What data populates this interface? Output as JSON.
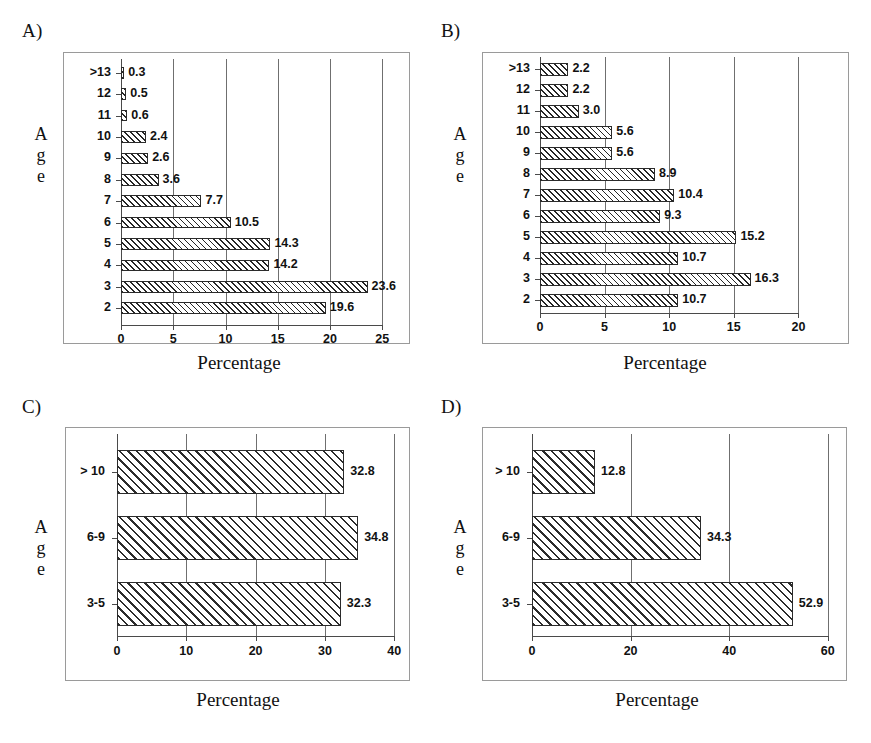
{
  "figure": {
    "panels": [
      {
        "letter": "A)",
        "axis_label_y": "Age",
        "axis_label_x": "Percentage",
        "categories": [
          ">13",
          "12",
          "11",
          "10",
          "9",
          "8",
          "7",
          "6",
          "5",
          "4",
          "3",
          "2"
        ],
        "values": [
          0.3,
          0.5,
          0.6,
          2.4,
          2.6,
          3.6,
          7.7,
          10.5,
          14.3,
          14.2,
          23.6,
          19.6
        ],
        "value_labels": [
          "0.3",
          "0.5",
          "0.6",
          "2.4",
          "2.6",
          "3.6",
          "7.7",
          "10.5",
          "14.3",
          "14.2",
          "23.6",
          "19.6"
        ],
        "xticks": [
          0,
          5,
          10,
          15,
          20,
          25
        ],
        "xtick_labels": [
          "0",
          "5",
          "10",
          "15",
          "20",
          "25"
        ],
        "xlim": [
          0,
          25
        ]
      },
      {
        "letter": "B)",
        "axis_label_y": "Age",
        "axis_label_x": "Percentage",
        "categories": [
          ">13",
          "12",
          "11",
          "10",
          "9",
          "8",
          "7",
          "6",
          "5",
          "4",
          "3",
          "2"
        ],
        "values": [
          2.2,
          2.2,
          3.0,
          5.6,
          5.6,
          8.9,
          10.4,
          9.3,
          15.2,
          10.7,
          16.3,
          10.7
        ],
        "value_labels": [
          "2.2",
          "2.2",
          "3.0",
          "5.6",
          "5.6",
          "8.9",
          "10.4",
          "9.3",
          "15.2",
          "10.7",
          "16.3",
          "10.7"
        ],
        "xticks": [
          0,
          5,
          10,
          15,
          20
        ],
        "xtick_labels": [
          "0",
          "5",
          "10",
          "15",
          "20"
        ],
        "xlim": [
          0,
          20
        ]
      },
      {
        "letter": "C)",
        "axis_label_y": "Age",
        "axis_label_x": "Percentage",
        "categories": [
          "> 10",
          "6-9",
          "3-5"
        ],
        "values": [
          32.8,
          34.8,
          32.3
        ],
        "value_labels": [
          "32.8",
          "34.8",
          "32.3"
        ],
        "xticks": [
          0,
          10,
          20,
          30,
          40
        ],
        "xtick_labels": [
          "0",
          "10",
          "20",
          "30",
          "40"
        ],
        "xlim": [
          0,
          40
        ]
      },
      {
        "letter": "D)",
        "axis_label_y": "Age",
        "axis_label_x": "Percentage",
        "categories": [
          "> 10",
          "6-9",
          "3-5"
        ],
        "values": [
          12.8,
          34.3,
          52.9
        ],
        "value_labels": [
          "12.8",
          "34.3",
          "52.9"
        ],
        "xticks": [
          0,
          20,
          40,
          60
        ],
        "xtick_labels": [
          "0",
          "20",
          "40",
          "60"
        ],
        "xlim": [
          0,
          60
        ]
      }
    ]
  },
  "chart_data": [
    {
      "type": "bar",
      "orientation": "horizontal",
      "panel": "A",
      "title": "A)",
      "categories": [
        ">13",
        "12",
        "11",
        "10",
        "9",
        "8",
        "7",
        "6",
        "5",
        "4",
        "3",
        "2"
      ],
      "values": [
        0.3,
        0.5,
        0.6,
        2.4,
        2.6,
        3.6,
        7.7,
        10.5,
        14.3,
        14.2,
        23.6,
        19.6
      ],
      "xlabel": "Percentage",
      "ylabel": "Age",
      "xlim": [
        0,
        25
      ],
      "xticks": [
        0,
        5,
        10,
        15,
        20,
        25
      ],
      "grid": true,
      "legend": false,
      "data_labels": true
    },
    {
      "type": "bar",
      "orientation": "horizontal",
      "panel": "B",
      "title": "B)",
      "categories": [
        ">13",
        "12",
        "11",
        "10",
        "9",
        "8",
        "7",
        "6",
        "5",
        "4",
        "3",
        "2"
      ],
      "values": [
        2.2,
        2.2,
        3.0,
        5.6,
        5.6,
        8.9,
        10.4,
        9.3,
        15.2,
        10.7,
        16.3,
        10.7
      ],
      "xlabel": "Percentage",
      "ylabel": "Age",
      "xlim": [
        0,
        20
      ],
      "xticks": [
        0,
        5,
        10,
        15,
        20
      ],
      "grid": true,
      "legend": false,
      "data_labels": true
    },
    {
      "type": "bar",
      "orientation": "horizontal",
      "panel": "C",
      "title": "C)",
      "categories": [
        "> 10",
        "6-9",
        "3-5"
      ],
      "values": [
        32.8,
        34.8,
        32.3
      ],
      "xlabel": "Percentage",
      "ylabel": "Age",
      "xlim": [
        0,
        40
      ],
      "xticks": [
        0,
        10,
        20,
        30,
        40
      ],
      "grid": true,
      "legend": false,
      "data_labels": true
    },
    {
      "type": "bar",
      "orientation": "horizontal",
      "panel": "D",
      "title": "D)",
      "categories": [
        "> 10",
        "6-9",
        "3-5"
      ],
      "values": [
        12.8,
        34.3,
        52.9
      ],
      "xlabel": "Percentage",
      "ylabel": "Age",
      "xlim": [
        0,
        60
      ],
      "xticks": [
        0,
        20,
        40,
        60
      ],
      "grid": true,
      "legend": false,
      "data_labels": true
    }
  ]
}
